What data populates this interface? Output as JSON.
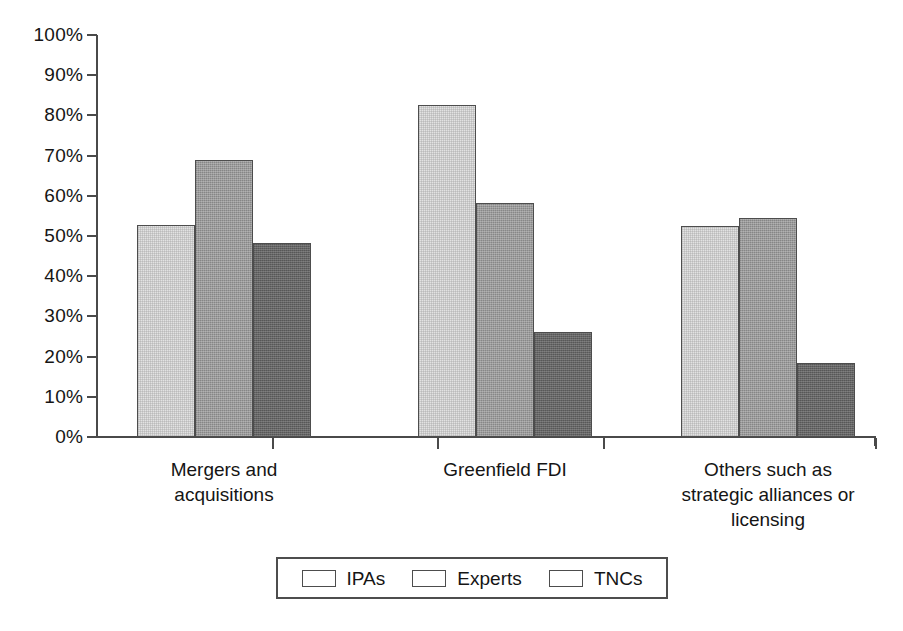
{
  "chart_data": {
    "type": "bar",
    "title": "",
    "subtitle": "",
    "xlabel": "",
    "ylabel": "",
    "ylim": [
      0,
      100
    ],
    "y_unit": "%",
    "grid": false,
    "legend_position": "bottom",
    "categories": [
      "Mergers and acquisitions",
      "Greenfield FDI",
      "Others such as strategic alliances or licensing"
    ],
    "category_label_lines": [
      [
        "Mergers and",
        "acquisitions"
      ],
      [
        "Greenfield FDI"
      ],
      [
        "Others such as",
        "strategic alliances or",
        "licensing"
      ]
    ],
    "series": [
      {
        "name": "IPAs",
        "color": "#e2e2e2",
        "values": [
          52.8,
          82.5,
          52.5
        ]
      },
      {
        "name": "Experts",
        "color": "#9b9b9b",
        "values": [
          68.8,
          58.3,
          54.5
        ]
      },
      {
        "name": "TNCs",
        "color": "#666666",
        "values": [
          48.2,
          26.0,
          18.5
        ]
      }
    ],
    "y_ticks": [
      {
        "value": 100,
        "label": "100%"
      },
      {
        "value": 90,
        "label": "90%"
      },
      {
        "value": 80,
        "label": "80%"
      },
      {
        "value": 70,
        "label": "70%"
      },
      {
        "value": 60,
        "label": "60%"
      },
      {
        "value": 50,
        "label": "50%"
      },
      {
        "value": 40,
        "label": "40%"
      },
      {
        "value": 30,
        "label": "30%"
      },
      {
        "value": 20,
        "label": "20%"
      },
      {
        "value": 10,
        "label": "10%"
      },
      {
        "value": 0,
        "label": "0%"
      }
    ]
  },
  "legend": {
    "items": [
      {
        "label": "IPAs",
        "color": "#e2e2e2",
        "swatch_class": "s-ipas"
      },
      {
        "label": "Experts",
        "color": "#9b9b9b",
        "swatch_class": "s-experts"
      },
      {
        "label": "TNCs",
        "color": "#666666",
        "swatch_class": "s-tncs"
      }
    ]
  },
  "geometry": {
    "plot_left": 97,
    "plot_top": 35,
    "plot_width": 778,
    "plot_height": 402,
    "group_centers": [
      224,
      505,
      768
    ],
    "bar_width": 58,
    "group_tick_x": [
      272,
      437,
      603,
      875
    ]
  }
}
